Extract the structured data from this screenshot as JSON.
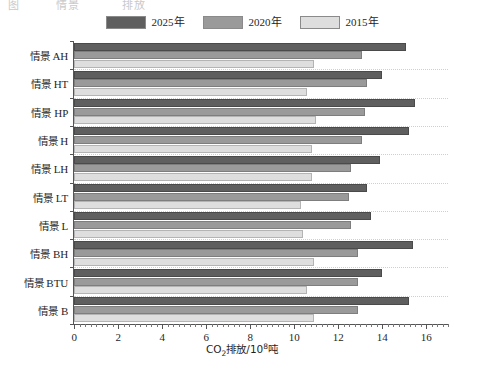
{
  "top_partial_text": [
    "图",
    "情景",
    "排放"
  ],
  "legend": {
    "position": "top-center",
    "items": [
      {
        "label": "2025年",
        "color": "#5f5f5f"
      },
      {
        "label": "2020年",
        "color": "#9a9a9a"
      },
      {
        "label": "2015年",
        "color": "#dedede"
      }
    ]
  },
  "axis": {
    "x_title_prefix": "CO",
    "x_title_sub": "2",
    "x_title_mid": "排放/10",
    "x_title_sup": "8",
    "x_title_suffix": "吨",
    "x_ticks": [
      "0",
      "2",
      "4",
      "6",
      "8",
      "10",
      "12",
      "14",
      "16"
    ]
  },
  "chart_data": {
    "type": "bar",
    "orientation": "horizontal",
    "title": "",
    "xlabel": "CO2排放/10^8吨",
    "ylabel": "",
    "xlim": [
      0,
      17
    ],
    "grid": true,
    "legend_position": "top-center",
    "categories": [
      "情景 AH",
      "情景 HT",
      "情景 HP",
      "情景 H",
      "情景 LH",
      "情景 LT",
      "情景 L",
      "情景 BH",
      "情景 BTU",
      "情景 B"
    ],
    "category_parts": [
      {
        "prefix": "情景",
        "code": "AH"
      },
      {
        "prefix": "情景",
        "code": "HT"
      },
      {
        "prefix": "情景",
        "code": "HP"
      },
      {
        "prefix": "情景",
        "code": "H"
      },
      {
        "prefix": "情景",
        "code": "LH"
      },
      {
        "prefix": "情景",
        "code": "LT"
      },
      {
        "prefix": "情景",
        "code": "L"
      },
      {
        "prefix": "情景",
        "code": "BH"
      },
      {
        "prefix": "情景",
        "code": "BTU"
      },
      {
        "prefix": "情景",
        "code": "B"
      }
    ],
    "series": [
      {
        "name": "2025年",
        "color": "#5f5f5f",
        "values": [
          15.1,
          14.0,
          15.5,
          15.2,
          13.9,
          13.3,
          13.5,
          15.4,
          14.0,
          15.2
        ]
      },
      {
        "name": "2020年",
        "color": "#9a9a9a",
        "values": [
          13.1,
          13.3,
          13.2,
          13.1,
          12.6,
          12.5,
          12.6,
          12.9,
          12.9,
          12.9
        ]
      },
      {
        "name": "2015年",
        "color": "#dedede",
        "values": [
          10.9,
          10.6,
          11.0,
          10.8,
          10.8,
          10.3,
          10.4,
          10.9,
          10.6,
          10.9
        ]
      }
    ]
  }
}
